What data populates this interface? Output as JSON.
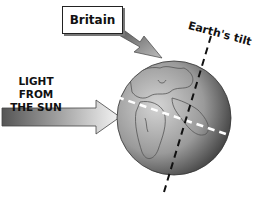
{
  "diagram": {
    "labels": {
      "britain": "Britain",
      "sun_line1": "LIGHT FROM",
      "sun_line2": "THE SUN",
      "tilt": "Earth's tilt"
    },
    "colors": {
      "background": "#ffffff",
      "globe_light": "#c8c8c8",
      "globe_dark": "#3a3a3a",
      "arrow_dark": "#555555",
      "arrow_light": "#e8e8e8",
      "equator_line": "#ffffff",
      "tilt_line": "#111111"
    },
    "elements": [
      {
        "id": "britain-label-box",
        "text": "Britain"
      },
      {
        "id": "britain-pointer-arrow",
        "points_to": "Britain on globe"
      },
      {
        "id": "sunlight-arrow",
        "text": "LIGHT FROM THE SUN"
      },
      {
        "id": "earth-globe"
      },
      {
        "id": "equator-dashed-line"
      },
      {
        "id": "tilt-axis-dashed-line",
        "text": "Earth's tilt"
      }
    ]
  }
}
